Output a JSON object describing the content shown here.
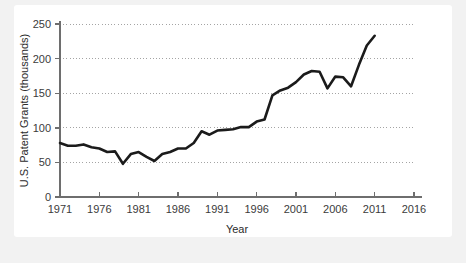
{
  "chart_data": {
    "type": "line",
    "title": "",
    "xlabel": "Year",
    "ylabel": "U.S. Patent Grants (thousands)",
    "xlim": [
      1971,
      2016
    ],
    "ylim": [
      0,
      250
    ],
    "grid": "horizontal-dotted",
    "legend": "none",
    "x_ticks": [
      "1971",
      "1976",
      "1981",
      "1986",
      "1991",
      "1996",
      "2001",
      "2006",
      "2011",
      "2016"
    ],
    "x_tick_values": [
      1971,
      1976,
      1981,
      1986,
      1991,
      1996,
      2001,
      2006,
      2011,
      2016
    ],
    "y_ticks": [
      "0",
      "50",
      "100",
      "150",
      "200",
      "250"
    ],
    "y_tick_values": [
      0,
      50,
      100,
      150,
      200,
      250
    ],
    "series": [
      {
        "name": "U.S. Patent Grants",
        "x": [
          1971,
          1972,
          1973,
          1974,
          1975,
          1976,
          1977,
          1978,
          1979,
          1980,
          1981,
          1982,
          1983,
          1984,
          1985,
          1986,
          1987,
          1988,
          1989,
          1990,
          1991,
          1992,
          1993,
          1994,
          1995,
          1996,
          1997,
          1998,
          1999,
          2000,
          2001,
          2002,
          2003,
          2004,
          2005,
          2006,
          2007,
          2008,
          2009,
          2010,
          2011
        ],
        "values": [
          78,
          74,
          74,
          76,
          72,
          70,
          65,
          66,
          48,
          62,
          65,
          58,
          52,
          62,
          65,
          70,
          70,
          78,
          95,
          90,
          96,
          97,
          98,
          101,
          101,
          109,
          112,
          147,
          154,
          158,
          166,
          177,
          182,
          181,
          157,
          174,
          173,
          160,
          191,
          219,
          233
        ]
      }
    ]
  },
  "figure": {
    "card_background": "#ffffff",
    "page_background": "#f2f2f2",
    "line_color": "#1b1b1b",
    "axis_color": "#6e6e6e",
    "grid_color": "#9a9a9a"
  }
}
